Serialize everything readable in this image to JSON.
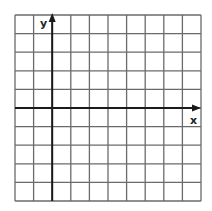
{
  "diagram": {
    "type": "coordinate-grid",
    "columns": 10,
    "rows": 10,
    "y_axis_column": 2,
    "x_axis_row": 5,
    "labels": {
      "x_axis": "x",
      "y_axis": "y"
    },
    "colors": {
      "grid_line": "#6a6a6a",
      "axis_line": "#1a1a1a",
      "background": "#ffffff"
    }
  }
}
